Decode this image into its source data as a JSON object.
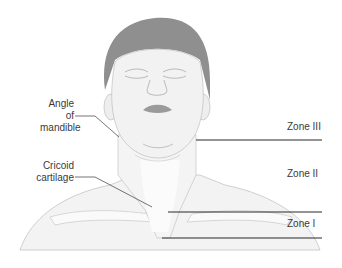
{
  "diagram": {
    "labels": {
      "angle_of_mandible": [
        "Angle of",
        "mandible"
      ],
      "cricoid_cartilage": [
        "Cricoid",
        "cartilage"
      ],
      "zone_3": "Zone III",
      "zone_2": "Zone II",
      "zone_1": "Zone I"
    },
    "colors": {
      "hair": "#8f8f8f",
      "skin": "#f2f2f2",
      "outline": "#b5b5b5",
      "lines": "#2a2a2a",
      "text": "#3a3a3a",
      "lips": "#9a9a9a"
    }
  }
}
